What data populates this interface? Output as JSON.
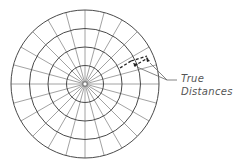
{
  "diagram": {
    "center": [
      85,
      84
    ],
    "circle_radii": [
      18.5,
      37,
      55.5,
      74
    ],
    "center_hole_radius": 2.2,
    "radial_line_count": 24,
    "colors": {
      "circle": "#4a4a4a",
      "radial": "#8a8a8a",
      "dashed": "#222222",
      "leader": "#666666",
      "text": "#555555"
    },
    "annotation": {
      "line1": "True",
      "line2": "Distances"
    }
  }
}
